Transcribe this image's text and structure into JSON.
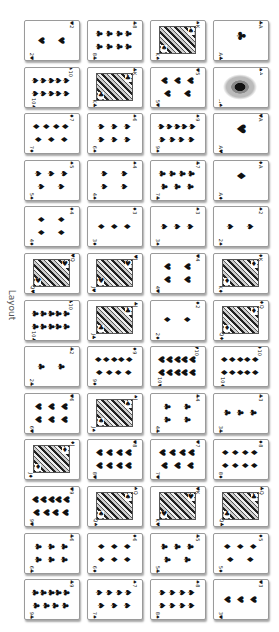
{
  "page": {
    "label": "Layout"
  },
  "cards": [
    {
      "rank": "2",
      "suit": "♥",
      "type": "pips",
      "pips": 2
    },
    {
      "rank": "8",
      "suit": "♣",
      "type": "pips",
      "pips": 8
    },
    {
      "rank": "K",
      "suit": "♠",
      "type": "face"
    },
    {
      "rank": "A",
      "suit": "♣",
      "type": "ace"
    },
    {
      "rank": "10",
      "suit": "♠",
      "type": "pips",
      "pips": 10
    },
    {
      "rank": "K",
      "suit": "♣",
      "type": "face"
    },
    {
      "rank": "5",
      "suit": "♥",
      "type": "pips",
      "pips": 5
    },
    {
      "rank": "A",
      "suit": "♠",
      "type": "ace-ornate"
    },
    {
      "rank": "7",
      "suit": "♦",
      "type": "pips",
      "pips": 7
    },
    {
      "rank": "6",
      "suit": "♠",
      "type": "pips",
      "pips": 6
    },
    {
      "rank": "9",
      "suit": "♠",
      "type": "pips",
      "pips": 9
    },
    {
      "rank": "A",
      "suit": "♥",
      "type": "ace"
    },
    {
      "rank": "5",
      "suit": "♠",
      "type": "pips",
      "pips": 5
    },
    {
      "rank": "4",
      "suit": "♠",
      "type": "pips",
      "pips": 4
    },
    {
      "rank": "7",
      "suit": "♣",
      "type": "pips",
      "pips": 7
    },
    {
      "rank": "A",
      "suit": "♦",
      "type": "ace"
    },
    {
      "rank": "4",
      "suit": "♦",
      "type": "pips",
      "pips": 4
    },
    {
      "rank": "3",
      "suit": "♦",
      "type": "pips",
      "pips": 3
    },
    {
      "rank": "3",
      "suit": "♠",
      "type": "pips",
      "pips": 3
    },
    {
      "rank": "2",
      "suit": "♠",
      "type": "pips",
      "pips": 2
    },
    {
      "rank": "Q",
      "suit": "♥",
      "type": "face"
    },
    {
      "rank": "J",
      "suit": "♥",
      "type": "face"
    },
    {
      "rank": "4",
      "suit": "♥",
      "type": "pips",
      "pips": 4
    },
    {
      "rank": "K",
      "suit": "♦",
      "type": "face"
    },
    {
      "rank": "10",
      "suit": "♣",
      "type": "pips",
      "pips": 10
    },
    {
      "rank": "J",
      "suit": "♣",
      "type": "face"
    },
    {
      "rank": "2",
      "suit": "♦",
      "type": "pips",
      "pips": 2
    },
    {
      "rank": "Q",
      "suit": "♦",
      "type": "face"
    },
    {
      "rank": "2",
      "suit": "♣",
      "type": "pips",
      "pips": 2
    },
    {
      "rank": "9",
      "suit": "♦",
      "type": "pips",
      "pips": 9
    },
    {
      "rank": "10",
      "suit": "♥",
      "type": "pips",
      "pips": 10
    },
    {
      "rank": "10",
      "suit": "♦",
      "type": "pips",
      "pips": 10
    },
    {
      "rank": "6",
      "suit": "♥",
      "type": "pips",
      "pips": 6
    },
    {
      "rank": "J",
      "suit": "♠",
      "type": "face"
    },
    {
      "rank": "4",
      "suit": "♣",
      "type": "pips",
      "pips": 4
    },
    {
      "rank": "3",
      "suit": "♣",
      "type": "pips",
      "pips": 3
    },
    {
      "rank": "J",
      "suit": "♦",
      "type": "face"
    },
    {
      "rank": "8",
      "suit": "♥",
      "type": "pips",
      "pips": 8
    },
    {
      "rank": "7",
      "suit": "♥",
      "type": "pips",
      "pips": 7
    },
    {
      "rank": "8",
      "suit": "♦",
      "type": "pips",
      "pips": 8
    },
    {
      "rank": "9",
      "suit": "♥",
      "type": "pips",
      "pips": 9
    },
    {
      "rank": "Q",
      "suit": "♠",
      "type": "face"
    },
    {
      "rank": "K",
      "suit": "♥",
      "type": "face"
    },
    {
      "rank": "Q",
      "suit": "♣",
      "type": "face"
    },
    {
      "rank": "6",
      "suit": "♣",
      "type": "pips",
      "pips": 6
    },
    {
      "rank": "6",
      "suit": "♦",
      "type": "pips",
      "pips": 6
    },
    {
      "rank": "5",
      "suit": "♣",
      "type": "pips",
      "pips": 5
    },
    {
      "rank": "5",
      "suit": "♦",
      "type": "pips",
      "pips": 5
    },
    {
      "rank": "9",
      "suit": "♣",
      "type": "pips",
      "pips": 9
    },
    {
      "rank": "7",
      "suit": "♠",
      "type": "pips",
      "pips": 7
    },
    {
      "rank": "8",
      "suit": "♠",
      "type": "pips",
      "pips": 8
    },
    {
      "rank": "3",
      "suit": "♥",
      "type": "pips",
      "pips": 3
    }
  ]
}
